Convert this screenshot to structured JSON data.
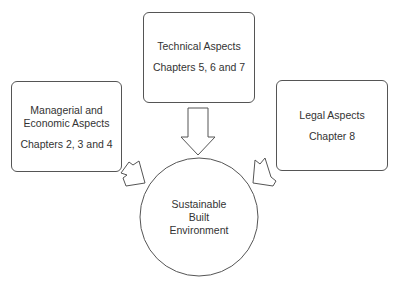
{
  "diagram": {
    "nodes": [
      {
        "id": "technical",
        "title": "Technical Aspects",
        "subtitle": "Chapters 5, 6 and 7"
      },
      {
        "id": "managerial",
        "title_lines": [
          "Managerial and",
          "Economic Aspects"
        ],
        "subtitle": "Chapters 2, 3 and 4"
      },
      {
        "id": "legal",
        "title": "Legal Aspects",
        "subtitle": "Chapter 8"
      }
    ],
    "center": {
      "lines": [
        "Sustainable",
        "Built",
        "Environment"
      ]
    },
    "edges": [
      {
        "from": "technical",
        "to": "center"
      },
      {
        "from": "managerial",
        "to": "center"
      },
      {
        "from": "legal",
        "to": "center"
      }
    ]
  },
  "colors": {
    "stroke": "#555555",
    "text": "#333333",
    "background": "#ffffff"
  }
}
